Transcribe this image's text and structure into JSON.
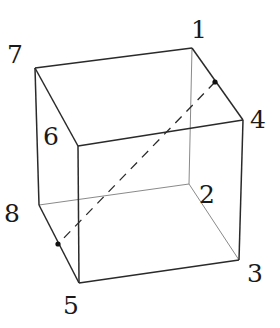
{
  "diagram": {
    "type": "cube-wireframe",
    "vertices": [
      {
        "id": "1",
        "label": "1",
        "x": 192,
        "y": 48,
        "label_x": 191,
        "label_y": 38
      },
      {
        "id": "2",
        "label": "2",
        "x": 189,
        "y": 184,
        "label_x": 199,
        "label_y": 203
      },
      {
        "id": "3",
        "label": "3",
        "x": 239,
        "y": 260,
        "label_x": 247,
        "label_y": 282
      },
      {
        "id": "4",
        "label": "4",
        "x": 243,
        "y": 120,
        "label_x": 250,
        "label_y": 128
      },
      {
        "id": "5",
        "label": "5",
        "x": 79,
        "y": 283,
        "label_x": 63,
        "label_y": 314
      },
      {
        "id": "6",
        "label": "6",
        "x": 78,
        "y": 146,
        "label_x": 43,
        "label_y": 145
      },
      {
        "id": "7",
        "label": "7",
        "x": 35,
        "y": 68,
        "label_x": 7,
        "label_y": 63
      },
      {
        "id": "8",
        "label": "8",
        "x": 39,
        "y": 205,
        "label_x": 4,
        "label_y": 222
      }
    ],
    "visible_edges": [
      [
        "7",
        "1"
      ],
      [
        "1",
        "4"
      ],
      [
        "4",
        "6"
      ],
      [
        "6",
        "7"
      ],
      [
        "7",
        "8"
      ],
      [
        "8",
        "5"
      ],
      [
        "5",
        "6"
      ],
      [
        "5",
        "3"
      ],
      [
        "3",
        "4"
      ]
    ],
    "hidden_edges": [
      [
        "1",
        "2"
      ],
      [
        "2",
        "3"
      ],
      [
        "2",
        "8"
      ]
    ],
    "dashed_line": {
      "from": {
        "x": 215,
        "y": 82
      },
      "to": {
        "x": 58,
        "y": 244
      }
    },
    "points": [
      {
        "name": "point-on-edge-1-4",
        "x": 215,
        "y": 82
      },
      {
        "name": "point-on-edge-8-5",
        "x": 58,
        "y": 244
      }
    ],
    "colors": {
      "visible_edge": "#2a2a2a",
      "hidden_edge": "#8a8a8a",
      "label": "#1a1a1a",
      "dashed": "#2a2a2a"
    }
  }
}
